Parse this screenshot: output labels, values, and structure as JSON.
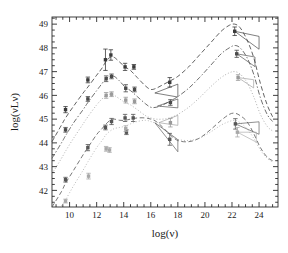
{
  "chart_data": {
    "type": "scatter",
    "title": "",
    "xlabel": "log(ν)",
    "ylabel": "log(νLν)",
    "xlim": [
      8.7,
      25.4
    ],
    "ylim": [
      41.3,
      49.3
    ],
    "xticks": [
      10,
      12,
      14,
      16,
      18,
      20,
      22,
      24
    ],
    "xticklabels": [
      "10",
      "12",
      "14",
      "16",
      "18",
      "20",
      "22",
      "24"
    ],
    "yticks": [
      42,
      43,
      44,
      45,
      46,
      47,
      48,
      49
    ],
    "yticklabels": [
      "42",
      "43",
      "44",
      "45",
      "46",
      "47",
      "48",
      "49"
    ],
    "xminor_step": 0.5,
    "yminor_step": 0.25,
    "grid": false,
    "legend": false,
    "frame": true,
    "tick_direction": "in",
    "series": [
      {
        "name": "sed-curve-1",
        "style": "dashed",
        "color": "#3a3a3a",
        "curve": [
          [
            8.7,
            44.05
          ],
          [
            9.4,
            44.75
          ],
          [
            9.7,
            45.05
          ],
          [
            10.3,
            45.55
          ],
          [
            11.0,
            46.1
          ],
          [
            11.35,
            46.35
          ],
          [
            12.0,
            46.85
          ],
          [
            12.4,
            47.15
          ],
          [
            12.7,
            47.45
          ],
          [
            13.0,
            47.6
          ],
          [
            13.3,
            47.6
          ],
          [
            13.7,
            47.4
          ],
          [
            14.1,
            47.2
          ],
          [
            14.5,
            47.05
          ],
          [
            15.0,
            46.75
          ],
          [
            15.6,
            46.4
          ],
          [
            16.0,
            46.25
          ],
          [
            16.4,
            46.3
          ],
          [
            16.9,
            46.45
          ],
          [
            17.4,
            46.6
          ],
          [
            18.0,
            46.8
          ],
          [
            18.8,
            47.2
          ],
          [
            19.6,
            47.7
          ],
          [
            20.4,
            48.2
          ],
          [
            21.2,
            48.7
          ],
          [
            21.8,
            48.95
          ],
          [
            22.2,
            49.0
          ],
          [
            22.6,
            48.85
          ],
          [
            23.1,
            48.35
          ],
          [
            23.6,
            47.6
          ],
          [
            24.1,
            46.5
          ],
          [
            24.6,
            45.6
          ],
          [
            25.0,
            45.1
          ]
        ],
        "points": [
          {
            "x": 9.7,
            "y": 45.4,
            "yerr": 0.13
          },
          {
            "x": 11.35,
            "y": 46.65,
            "yerr": 0.12
          },
          {
            "x": 12.65,
            "y": 47.5,
            "yerr": 0.45
          },
          {
            "x": 13.05,
            "y": 47.7,
            "yerr": 0.22
          },
          {
            "x": 14.1,
            "y": 47.2,
            "yerr": 0.15
          },
          {
            "x": 14.75,
            "y": 47.2,
            "yerr": 0.1
          },
          {
            "x": 17.4,
            "y": 46.55,
            "yerr": 0.2
          },
          {
            "x": 22.2,
            "y": 48.7,
            "yerr": 0.18
          }
        ],
        "bowties": [
          {
            "x0": 16.3,
            "x1": 18.0,
            "y0": 46.1,
            "y1": 46.45,
            "slope_lo": -0.1,
            "slope_hi": 0.22
          },
          {
            "x0": 22.2,
            "x1": 24.0,
            "y0": 48.7,
            "y1": 48.2,
            "slope_lo": -0.42,
            "slope_hi": -0.12
          }
        ]
      },
      {
        "name": "sed-curve-2",
        "style": "dash-dot",
        "color": "#4a4a4a",
        "curve": [
          [
            8.7,
            43.35
          ],
          [
            9.4,
            44.0
          ],
          [
            9.7,
            44.3
          ],
          [
            10.3,
            44.85
          ],
          [
            11.0,
            45.4
          ],
          [
            11.35,
            45.7
          ],
          [
            12.0,
            46.2
          ],
          [
            12.4,
            46.5
          ],
          [
            12.7,
            46.7
          ],
          [
            13.0,
            46.8
          ],
          [
            13.3,
            46.8
          ],
          [
            13.7,
            46.6
          ],
          [
            14.1,
            46.35
          ],
          [
            14.5,
            46.2
          ],
          [
            15.0,
            45.95
          ],
          [
            15.6,
            45.65
          ],
          [
            16.0,
            45.5
          ],
          [
            16.4,
            45.5
          ],
          [
            16.9,
            45.6
          ],
          [
            17.4,
            45.75
          ],
          [
            18.0,
            45.95
          ],
          [
            18.8,
            46.3
          ],
          [
            19.6,
            46.75
          ],
          [
            20.4,
            47.25
          ],
          [
            21.2,
            47.75
          ],
          [
            21.8,
            48.0
          ],
          [
            22.2,
            48.1
          ],
          [
            22.6,
            48.0
          ],
          [
            23.1,
            47.6
          ],
          [
            23.6,
            46.9
          ],
          [
            24.1,
            45.9
          ],
          [
            24.6,
            45.2
          ],
          [
            25.0,
            44.9
          ]
        ],
        "points": [
          {
            "x": 9.7,
            "y": 44.55,
            "yerr": 0.1
          },
          {
            "x": 11.35,
            "y": 45.85,
            "yerr": 0.1
          },
          {
            "x": 12.7,
            "y": 46.7,
            "yerr": 0.12
          },
          {
            "x": 13.1,
            "y": 46.8,
            "yerr": 0.1
          },
          {
            "x": 14.15,
            "y": 46.3,
            "yerr": 0.15
          },
          {
            "x": 14.8,
            "y": 46.25,
            "yerr": 0.1
          },
          {
            "x": 17.45,
            "y": 45.7,
            "yerr": 0.12
          },
          {
            "x": 22.35,
            "y": 47.75,
            "yerr": 0.15
          }
        ],
        "bowties": [
          {
            "x0": 16.5,
            "x1": 18.0,
            "y0": 45.55,
            "y1": 45.8,
            "slope_lo": -0.05,
            "slope_hi": 0.2
          },
          {
            "x0": 22.35,
            "x1": 23.7,
            "y0": 47.75,
            "y1": 47.4,
            "slope_lo": -0.4,
            "slope_hi": -0.1
          }
        ]
      },
      {
        "name": "sed-curve-3",
        "style": "dotted",
        "color": "#9a9a9a",
        "curve": [
          [
            8.7,
            42.7
          ],
          [
            9.4,
            43.35
          ],
          [
            9.7,
            43.65
          ],
          [
            10.3,
            44.2
          ],
          [
            11.0,
            44.8
          ],
          [
            11.35,
            45.1
          ],
          [
            12.0,
            45.6
          ],
          [
            12.4,
            45.85
          ],
          [
            12.7,
            46.0
          ],
          [
            13.0,
            46.05
          ],
          [
            13.3,
            46.0
          ],
          [
            13.7,
            45.85
          ],
          [
            14.1,
            45.7
          ],
          [
            14.5,
            45.6
          ],
          [
            15.0,
            45.4
          ],
          [
            15.6,
            45.15
          ],
          [
            16.0,
            45.05
          ],
          [
            16.4,
            45.0
          ],
          [
            16.9,
            45.0
          ],
          [
            17.4,
            45.05
          ],
          [
            18.0,
            45.2
          ],
          [
            18.8,
            45.5
          ],
          [
            19.6,
            45.9
          ],
          [
            20.4,
            46.35
          ],
          [
            21.2,
            46.75
          ],
          [
            21.8,
            46.95
          ],
          [
            22.2,
            47.0
          ],
          [
            22.6,
            46.9
          ],
          [
            23.1,
            46.55
          ],
          [
            23.6,
            45.95
          ],
          [
            24.1,
            45.2
          ],
          [
            24.6,
            44.7
          ],
          [
            25.0,
            44.5
          ]
        ],
        "points": [
          {
            "x": 12.7,
            "y": 46.0,
            "yerr": 0.12
          },
          {
            "x": 13.1,
            "y": 46.05,
            "yerr": 0.1
          },
          {
            "x": 14.15,
            "y": 45.8,
            "yerr": 0.12
          },
          {
            "x": 14.8,
            "y": 45.75,
            "yerr": 0.1
          },
          {
            "x": 17.45,
            "y": 44.85,
            "yerr": 0.18
          },
          {
            "x": 22.45,
            "y": 46.75,
            "yerr": 0.12
          }
        ],
        "bowties": [
          {
            "x0": 16.6,
            "x1": 18.0,
            "y0": 44.85,
            "y1": 45.05,
            "slope_lo": -0.08,
            "slope_hi": 0.22
          },
          {
            "x0": 22.45,
            "x1": 23.6,
            "y0": 46.75,
            "y1": 46.4,
            "slope_lo": -0.38,
            "slope_hi": -0.08
          }
        ]
      },
      {
        "name": "sed-curve-4",
        "style": "dashed",
        "color": "#555555",
        "curve": [
          [
            8.7,
            41.3
          ],
          [
            9.4,
            41.95
          ],
          [
            9.7,
            42.3
          ],
          [
            10.3,
            42.85
          ],
          [
            11.0,
            43.5
          ],
          [
            11.35,
            43.8
          ],
          [
            12.0,
            44.35
          ],
          [
            12.4,
            44.6
          ],
          [
            12.7,
            44.8
          ],
          [
            13.0,
            44.95
          ],
          [
            13.3,
            45.0
          ],
          [
            13.7,
            44.95
          ],
          [
            14.1,
            44.95
          ],
          [
            14.5,
            45.0
          ],
          [
            15.0,
            45.05
          ],
          [
            15.6,
            45.05
          ],
          [
            16.0,
            45.0
          ],
          [
            16.4,
            44.9
          ],
          [
            16.9,
            44.65
          ],
          [
            17.4,
            44.35
          ],
          [
            18.0,
            44.1
          ],
          [
            18.8,
            44.05
          ],
          [
            19.6,
            44.2
          ],
          [
            20.4,
            44.55
          ],
          [
            21.2,
            44.95
          ],
          [
            21.8,
            45.2
          ],
          [
            22.2,
            45.25
          ],
          [
            22.6,
            45.15
          ],
          [
            23.1,
            44.9
          ],
          [
            23.6,
            44.4
          ],
          [
            24.1,
            43.8
          ],
          [
            24.6,
            43.4
          ],
          [
            25.0,
            43.25
          ]
        ],
        "points": [
          {
            "x": 9.7,
            "y": 42.45,
            "yerr": 0.1
          },
          {
            "x": 11.35,
            "y": 43.8,
            "yerr": 0.13
          },
          {
            "x": 12.65,
            "y": 44.65,
            "yerr": 0.1
          },
          {
            "x": 13.1,
            "y": 44.9,
            "yerr": 0.13
          },
          {
            "x": 14.1,
            "y": 45.05,
            "yerr": 0.15
          },
          {
            "x": 14.7,
            "y": 45.05,
            "yerr": 0.15
          },
          {
            "x": 14.2,
            "y": 44.45,
            "yerr": 0.1
          },
          {
            "x": 17.4,
            "y": 44.15,
            "yerr": 0.25
          },
          {
            "x": 22.25,
            "y": 44.8,
            "yerr": 0.22
          }
        ],
        "bowties": [
          {
            "x0": 16.3,
            "x1": 18.0,
            "y0": 44.85,
            "y1": 43.9,
            "slope_lo": -0.72,
            "slope_hi": -0.42
          },
          {
            "x0": 22.25,
            "x1": 24.0,
            "y0": 44.8,
            "y1": 44.6,
            "slope_lo": -0.25,
            "slope_hi": 0.05
          }
        ]
      },
      {
        "name": "sed-curve-5",
        "style": "dotted",
        "color": "#a8a8a8",
        "curve": [
          [
            9.4,
            41.35
          ],
          [
            9.7,
            41.6
          ],
          [
            10.3,
            42.2
          ],
          [
            11.0,
            42.85
          ],
          [
            11.35,
            43.2
          ],
          [
            12.0,
            43.8
          ],
          [
            12.4,
            44.1
          ],
          [
            12.7,
            44.35
          ],
          [
            13.0,
            44.5
          ],
          [
            13.3,
            44.6
          ],
          [
            13.7,
            44.65
          ],
          [
            14.1,
            44.7
          ],
          [
            14.5,
            44.8
          ],
          [
            15.0,
            44.9
          ],
          [
            15.6,
            44.95
          ],
          [
            16.0,
            44.9
          ],
          [
            16.4,
            44.8
          ],
          [
            16.9,
            44.6
          ],
          [
            17.4,
            44.35
          ],
          [
            18.0,
            44.15
          ],
          [
            18.8,
            44.1
          ],
          [
            19.6,
            44.2
          ],
          [
            20.4,
            44.45
          ],
          [
            21.2,
            44.75
          ],
          [
            21.8,
            44.9
          ],
          [
            22.2,
            44.95
          ],
          [
            22.6,
            44.85
          ],
          [
            23.1,
            44.6
          ],
          [
            23.6,
            44.2
          ],
          [
            24.1,
            43.7
          ],
          [
            24.6,
            43.35
          ],
          [
            25.0,
            43.2
          ]
        ],
        "points": [
          {
            "x": 9.7,
            "y": 41.55,
            "yerr": 0.08
          },
          {
            "x": 11.4,
            "y": 42.6,
            "yerr": 0.12
          },
          {
            "x": 12.7,
            "y": 43.75,
            "yerr": 0.1
          },
          {
            "x": 12.95,
            "y": 43.7,
            "yerr": 0.1
          },
          {
            "x": 14.15,
            "y": 44.6,
            "yerr": 0.12
          },
          {
            "x": 22.4,
            "y": 44.45,
            "yerr": 0.2
          }
        ],
        "bowties": [
          {
            "x0": 22.4,
            "x1": 23.8,
            "y0": 44.45,
            "y1": 44.2,
            "slope_lo": -0.3,
            "slope_hi": 0.0
          }
        ]
      }
    ]
  }
}
